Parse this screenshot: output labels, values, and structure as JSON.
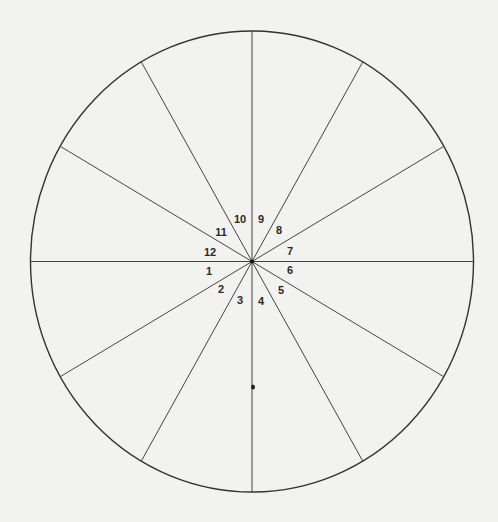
{
  "diagram": {
    "type": "segmented-circle",
    "segment_count": 12,
    "background": "#f2f2f0",
    "stroke_color": "#333333",
    "circle": {
      "cx": 252,
      "cy": 261.5,
      "rx": 221.5,
      "ry": 230.5
    },
    "segments": [
      {
        "label": "1",
        "x": 209,
        "y": 275
      },
      {
        "label": "2",
        "x": 221,
        "y": 293
      },
      {
        "label": "3",
        "x": 240,
        "y": 304
      },
      {
        "label": "4",
        "x": 261,
        "y": 305
      },
      {
        "label": "5",
        "x": 281,
        "y": 294
      },
      {
        "label": "6",
        "x": 290,
        "y": 274
      },
      {
        "label": "7",
        "x": 290,
        "y": 255
      },
      {
        "label": "8",
        "x": 279,
        "y": 234
      },
      {
        "label": "9",
        "x": 261,
        "y": 223
      },
      {
        "label": "10",
        "x": 240,
        "y": 223
      },
      {
        "label": "11",
        "x": 221,
        "y": 236
      },
      {
        "label": "12",
        "x": 210,
        "y": 256
      }
    ],
    "marker_dot": {
      "x": 253,
      "y": 387
    }
  }
}
